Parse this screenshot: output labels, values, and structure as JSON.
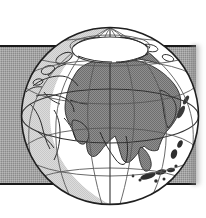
{
  "image": {
    "title": "Orthographic globe illustration centered on Asia",
    "style": "monochrome halftone line art",
    "width": 206,
    "height": 218
  },
  "band": {
    "name": "horizontal gray background band",
    "fill_color": "#8a8a8a",
    "border_color": "#1a1a1a",
    "left": 0,
    "top": 45,
    "width": 196,
    "height": 140
  },
  "globe": {
    "projection": "orthographic",
    "center_x": 110,
    "center_y": 116,
    "radius": 89,
    "sphere_fill": "#ffffff",
    "land_fill": "#8a8a8a",
    "limb_shadow_fill": "#cfcfcf",
    "outline_color": "#1f1f1f",
    "graticule_color": "#595959",
    "coastline_color": "#2a2a2a",
    "center_longitude": 80,
    "center_latitude": 30,
    "graticule_spacing_degrees": 30,
    "visible_features": [
      "North Pole region",
      "Arctic Circle",
      "Europe",
      "Mediterranean Sea",
      "Africa (north)",
      "Arabian Peninsula",
      "India",
      "Asia",
      "Siberia",
      "Southeast Asia",
      "Indonesian archipelago",
      "Japan",
      "Australia (north edge)",
      "Equator"
    ]
  },
  "labels": {
    "equator": "Equator",
    "arctic_circle": "Arctic Circle",
    "north_pole": "North Pole"
  }
}
